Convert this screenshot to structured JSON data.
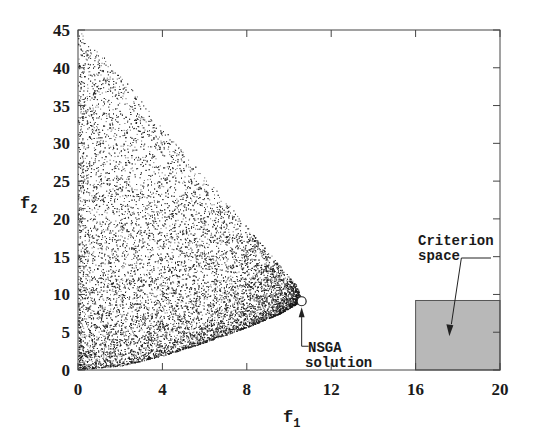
{
  "chart_data": {
    "type": "scatter",
    "title": "",
    "xlabel": "f1",
    "ylabel": "f2",
    "xlim": [
      0,
      20
    ],
    "ylim": [
      0,
      45
    ],
    "xticks": [
      0,
      4,
      8,
      12,
      16,
      20
    ],
    "yticks": [
      0,
      5,
      10,
      15,
      20,
      25,
      30,
      35,
      40,
      45
    ],
    "grid": false,
    "legend": null,
    "series": [
      {
        "name": "Feasible objective points",
        "description": "Dense random cloud of points bounded by f1>=0, upper boundary from (0,45) down to (10.6,9), lower boundary curve from (0,0) rising to (10.6,9)",
        "upper_boundary": [
          [
            0,
            45
          ],
          [
            2,
            39
          ],
          [
            4,
            32
          ],
          [
            6,
            25.5
          ],
          [
            8,
            19
          ],
          [
            9.5,
            14
          ],
          [
            10.4,
            11
          ],
          [
            10.6,
            9.1
          ]
        ],
        "lower_boundary": [
          [
            0,
            0
          ],
          [
            2,
            0.5
          ],
          [
            4,
            1.8
          ],
          [
            6,
            3.6
          ],
          [
            8,
            5.6
          ],
          [
            9.5,
            7.3
          ],
          [
            10.6,
            9.1
          ]
        ],
        "density": "darker near f1=0 and f2<15"
      },
      {
        "name": "NSGA solution",
        "points": [
          [
            10.6,
            9.1
          ]
        ],
        "marker": "open-circle"
      }
    ],
    "shapes": [
      {
        "name": "Criterion space",
        "type": "rect",
        "x": [
          16,
          20
        ],
        "y": [
          0,
          9.2
        ],
        "fill": "#b8b8b8"
      }
    ],
    "annotations": [
      {
        "text": "NSGA\nsolution",
        "points_to": [
          10.6,
          9.1
        ]
      },
      {
        "text": "Criterion\nspace",
        "points_to": [
          17.6,
          5
        ]
      }
    ]
  },
  "labels": {
    "xlabel_main": "f",
    "xlabel_sub": "1",
    "ylabel_main": "f",
    "ylabel_sub": "2",
    "nsga_line1": "NSGA",
    "nsga_line2": "solution",
    "crit_line1": "Criterion",
    "crit_line2": "space"
  },
  "colors": {
    "points": "#1a1a1a",
    "box_fill": "#b8b8b8",
    "axis": "#444444"
  }
}
